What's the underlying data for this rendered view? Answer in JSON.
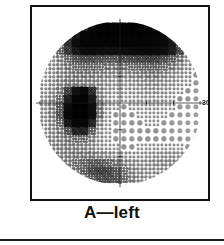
{
  "figure": {
    "caption": "A—left",
    "eye": "left",
    "panel_letter": "A"
  },
  "axis": {
    "outer_degree_label": "30",
    "horizontal_axis_label": "",
    "vertical_axis_label": ""
  },
  "chart_data": {
    "type": "heatmap",
    "title": "A—left",
    "subtitle": "",
    "xlabel": "",
    "ylabel": "",
    "grid": false,
    "legend_position": "none",
    "xlim": [
      -30,
      30
    ],
    "ylim": [
      -30,
      30
    ],
    "tick_labels_x": [
      "30"
    ],
    "tick_labels_y": [],
    "field_radius_deg": 30,
    "grid_spacing_deg": 3,
    "annotations": [
      {
        "label": "dense superior altitudinal defect",
        "x": 0,
        "y": 22
      },
      {
        "label": "dense paracentral/blind-spot scotoma",
        "x": -15,
        "y": -2
      }
    ],
    "cells_x": [
      -28.5,
      -25.5,
      -22.5,
      -19.5,
      -16.5,
      -13.5,
      -10.5,
      -7.5,
      -4.5,
      -1.5,
      1.5,
      4.5,
      7.5,
      10.5,
      13.5,
      16.5,
      19.5,
      22.5,
      25.5,
      28.5
    ],
    "cells_y": [
      28.5,
      25.5,
      22.5,
      19.5,
      16.5,
      13.5,
      10.5,
      7.5,
      4.5,
      1.5,
      -1.5,
      -4.5,
      -7.5,
      -10.5,
      -13.5,
      -16.5,
      -19.5,
      -22.5,
      -25.5,
      -28.5
    ],
    "values": [
      [
        null,
        null,
        null,
        null,
        null,
        0.62,
        0.88,
        0.95,
        0.95,
        0.95,
        0.96,
        0.96,
        0.95,
        0.9,
        0.72,
        0.55,
        null,
        null,
        null,
        null
      ],
      [
        null,
        null,
        null,
        0.45,
        0.72,
        0.9,
        0.95,
        0.96,
        0.96,
        0.96,
        0.96,
        0.96,
        0.96,
        0.95,
        0.92,
        0.8,
        0.58,
        null,
        null,
        null
      ],
      [
        null,
        null,
        0.35,
        0.62,
        0.82,
        0.92,
        0.95,
        0.95,
        0.95,
        0.95,
        0.95,
        0.95,
        0.95,
        0.94,
        0.9,
        0.86,
        0.74,
        0.45,
        null,
        null
      ],
      [
        null,
        0.25,
        0.42,
        0.58,
        0.72,
        0.8,
        0.82,
        0.8,
        0.78,
        0.78,
        0.8,
        0.82,
        0.84,
        0.86,
        0.84,
        0.8,
        0.7,
        0.52,
        0.3,
        null
      ],
      [
        null,
        0.2,
        0.3,
        0.4,
        0.48,
        0.52,
        0.52,
        0.5,
        0.48,
        0.48,
        0.5,
        0.52,
        0.54,
        0.56,
        0.55,
        0.5,
        0.44,
        0.35,
        0.22,
        null
      ],
      [
        0.16,
        0.22,
        0.28,
        0.34,
        0.38,
        0.4,
        0.4,
        0.38,
        0.36,
        0.35,
        0.36,
        0.38,
        0.4,
        0.42,
        0.42,
        0.38,
        0.34,
        0.28,
        0.2,
        0.14
      ],
      [
        0.16,
        0.22,
        0.28,
        0.32,
        0.34,
        0.35,
        0.34,
        0.32,
        0.3,
        0.28,
        0.28,
        0.3,
        0.32,
        0.34,
        0.34,
        0.3,
        0.26,
        0.22,
        0.18,
        0.12
      ],
      [
        0.18,
        0.24,
        0.3,
        0.34,
        0.34,
        0.33,
        0.31,
        0.28,
        0.25,
        0.22,
        0.22,
        0.24,
        0.26,
        0.28,
        0.28,
        0.25,
        0.22,
        0.18,
        0.15,
        0.1
      ],
      [
        0.2,
        0.26,
        0.34,
        0.55,
        0.78,
        0.88,
        0.62,
        0.3,
        0.22,
        0.18,
        0.18,
        0.2,
        0.22,
        0.24,
        0.24,
        0.21,
        0.18,
        0.15,
        0.12,
        0.08
      ],
      [
        0.22,
        0.28,
        0.38,
        0.7,
        0.92,
        0.95,
        0.72,
        0.32,
        0.2,
        0.15,
        0.15,
        0.17,
        0.19,
        0.2,
        0.2,
        0.18,
        0.15,
        0.12,
        0.1,
        0.07
      ],
      [
        0.22,
        0.3,
        0.45,
        0.82,
        0.97,
        0.97,
        0.8,
        0.35,
        0.18,
        0.13,
        0.12,
        0.14,
        0.16,
        0.17,
        0.17,
        0.15,
        0.13,
        0.1,
        0.08,
        0.06
      ],
      [
        0.22,
        0.3,
        0.48,
        0.86,
        0.98,
        0.98,
        0.82,
        0.36,
        0.17,
        0.12,
        0.11,
        0.12,
        0.14,
        0.15,
        0.15,
        0.13,
        0.11,
        0.09,
        0.07,
        0.05
      ],
      [
        0.2,
        0.28,
        0.4,
        0.72,
        0.92,
        0.92,
        0.66,
        0.28,
        0.15,
        0.11,
        0.1,
        0.11,
        0.12,
        0.13,
        0.13,
        0.11,
        0.1,
        0.08,
        0.06,
        0.05
      ],
      [
        0.2,
        0.26,
        0.32,
        0.48,
        0.66,
        0.66,
        0.44,
        0.22,
        0.14,
        0.1,
        0.09,
        0.1,
        0.11,
        0.12,
        0.12,
        0.1,
        0.09,
        0.07,
        0.06,
        0.05
      ],
      [
        0.22,
        0.26,
        0.3,
        0.34,
        0.38,
        0.38,
        0.3,
        0.2,
        0.14,
        0.11,
        0.1,
        0.1,
        0.11,
        0.12,
        0.12,
        0.11,
        0.1,
        0.09,
        0.08,
        0.07
      ],
      [
        0.24,
        0.28,
        0.3,
        0.32,
        0.32,
        0.3,
        0.26,
        0.2,
        0.16,
        0.13,
        0.12,
        0.12,
        0.13,
        0.14,
        0.15,
        0.15,
        0.14,
        0.13,
        0.12,
        0.1
      ],
      [
        null,
        0.28,
        0.3,
        0.32,
        0.34,
        0.34,
        0.34,
        0.3,
        0.26,
        0.22,
        0.2,
        0.18,
        0.18,
        0.2,
        0.22,
        0.24,
        0.24,
        0.22,
        0.18,
        null
      ],
      [
        null,
        null,
        0.28,
        0.32,
        0.38,
        0.42,
        0.46,
        0.46,
        0.42,
        0.36,
        0.3,
        0.26,
        0.24,
        0.24,
        0.26,
        0.28,
        0.28,
        0.24,
        null,
        null
      ],
      [
        null,
        null,
        null,
        0.3,
        0.36,
        0.44,
        0.52,
        0.56,
        0.54,
        0.46,
        0.38,
        0.3,
        0.26,
        0.24,
        0.24,
        0.24,
        0.22,
        null,
        null,
        null
      ],
      [
        null,
        null,
        null,
        null,
        null,
        0.34,
        0.44,
        0.5,
        0.52,
        0.48,
        0.4,
        0.32,
        0.26,
        0.22,
        0.2,
        0.18,
        null,
        null,
        null,
        null
      ]
    ],
    "colorscale": {
      "0.0": "#ffffff",
      "0.25": "#d0d0d0",
      "0.5": "#8c8c8c",
      "0.75": "#474747",
      "1.0": "#000000"
    }
  }
}
